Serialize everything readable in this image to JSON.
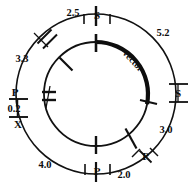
{
  "figure": {
    "type": "circular-restriction-map",
    "outer_circle_label": "insert map",
    "inner_circle_label": "vector"
  },
  "vector": {
    "label": "vector"
  },
  "distances": [
    {
      "id": "d-2-5",
      "value": "2.5"
    },
    {
      "id": "d-5-2",
      "value": "5.2"
    },
    {
      "id": "d-3-0",
      "value": "3.0"
    },
    {
      "id": "d-2-0",
      "value": "2.0"
    },
    {
      "id": "d-4-0",
      "value": "4.0"
    },
    {
      "id": "d-0-2",
      "value": "0.2"
    },
    {
      "id": "d-3-3",
      "value": "3.3"
    }
  ],
  "sites": [
    {
      "id": "site-s-top",
      "label": "S"
    },
    {
      "id": "site-s-right",
      "label": "S"
    },
    {
      "id": "site-p-bottom-right",
      "label": "P"
    },
    {
      "id": "site-p-bottom",
      "label": "P"
    },
    {
      "id": "site-x-left",
      "label": "X"
    },
    {
      "id": "site-p-left",
      "label": "P"
    }
  ],
  "colors": {
    "line": "#111111",
    "background": "#ffffff",
    "text": "#0d0d0d"
  }
}
